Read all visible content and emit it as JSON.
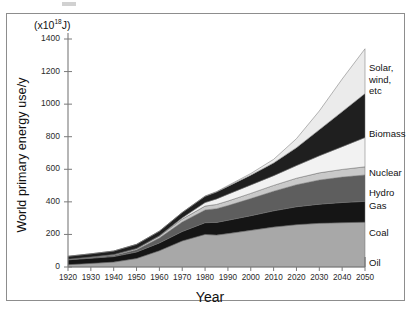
{
  "figure": {
    "unit_label_prefix": "(x10",
    "unit_label_exp": "18",
    "unit_label_suffix": "J)",
    "y_axis_title": "World primary energy use/y",
    "x_axis_title": "Year"
  },
  "chart_data": {
    "type": "area",
    "stacked": true,
    "title": "",
    "xlabel": "Year",
    "ylabel": "World primary energy use/y",
    "unit": "x10^18 J",
    "xlim": [
      1920,
      2050
    ],
    "ylim": [
      0,
      1400
    ],
    "grid": false,
    "legend_position": "right-inline",
    "xticks": [
      1920,
      1930,
      1940,
      1950,
      1960,
      1970,
      1980,
      1990,
      2000,
      2010,
      2020,
      2030,
      2040,
      2050
    ],
    "yticks": [
      0,
      200,
      400,
      600,
      800,
      1000,
      1200,
      1400
    ],
    "x": [
      1920,
      1930,
      1940,
      1950,
      1960,
      1970,
      1980,
      1985,
      1990,
      2000,
      2010,
      2020,
      2030,
      2040,
      2050
    ],
    "series": [
      {
        "name": "Oil",
        "color": "#a8a8a8",
        "values": [
          14,
          22,
          30,
          52,
          100,
          160,
          200,
          196,
          205,
          225,
          245,
          260,
          268,
          272,
          275
        ]
      },
      {
        "name": "Coal",
        "color": "#151515",
        "values": [
          30,
          32,
          34,
          40,
          48,
          58,
          72,
          78,
          82,
          90,
          100,
          110,
          118,
          124,
          128
        ]
      },
      {
        "name": "Gas",
        "color": "#5e5e5e",
        "values": [
          2,
          4,
          7,
          14,
          30,
          58,
          78,
          84,
          90,
          105,
          120,
          135,
          148,
          156,
          162
        ]
      },
      {
        "name": "Hydro",
        "color": "#c9c9c9",
        "values": [
          2,
          3,
          5,
          8,
          12,
          18,
          24,
          26,
          28,
          32,
          36,
          40,
          44,
          47,
          50
        ]
      },
      {
        "name": "Nuclear",
        "color": "#f2f2f2",
        "values": [
          0,
          0,
          0,
          0,
          2,
          8,
          22,
          34,
          42,
          52,
          60,
          78,
          105,
          140,
          180
        ]
      },
      {
        "name": "Biomass",
        "color": "#1f1f1f",
        "values": [
          18,
          20,
          22,
          25,
          28,
          32,
          38,
          42,
          48,
          60,
          78,
          110,
          160,
          215,
          270
        ]
      },
      {
        "name": "Solar, wind, etc",
        "color": "#ebebeb",
        "values": [
          0,
          0,
          0,
          0,
          0,
          1,
          2,
          3,
          5,
          10,
          22,
          55,
          115,
          200,
          275
        ]
      }
    ],
    "stack_totals": [
      66,
      81,
      98,
      139,
      220,
      335,
      436,
      463,
      500,
      574,
      661,
      788,
      958,
      1154,
      1340
    ],
    "legend_labels": [
      {
        "key": "solar",
        "lines": [
          "Solar,",
          "wind,",
          "etc"
        ],
        "y": 62
      },
      {
        "key": "biomass",
        "lines": [
          "Biomass"
        ],
        "y": 128
      },
      {
        "key": "nuclear",
        "lines": [
          "Nuclear"
        ],
        "y": 167
      },
      {
        "key": "hydro",
        "lines": [
          "Hydro"
        ],
        "y": 187
      },
      {
        "key": "gas",
        "lines": [
          "Gas"
        ],
        "y": 200
      },
      {
        "key": "coal",
        "lines": [
          "Coal"
        ],
        "y": 227
      },
      {
        "key": "oil",
        "lines": [
          "Oil"
        ],
        "y": 257
      }
    ]
  }
}
